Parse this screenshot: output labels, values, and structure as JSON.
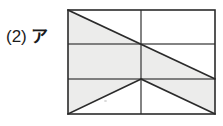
{
  "page": {
    "background_color": "#ffffff",
    "width": 223,
    "height": 126
  },
  "label": {
    "number": "(2)",
    "kana": "ア"
  },
  "figure": {
    "name": "subdivided-rectangle-with-diagonals",
    "stroke_color": "#2b2b2b",
    "grid_stroke_color": "#5a5a5a",
    "shade_color": "#ececeb",
    "stroke_width": 1.6,
    "grid_stroke_width": 1.5,
    "rect": {
      "x": 68,
      "y": 10,
      "width": 147,
      "height": 104
    },
    "rows_y": [
      10,
      44,
      79,
      114
    ],
    "cols_x": [
      68,
      141,
      215
    ],
    "diagonals": [
      {
        "name": "top-left-to-mid-right",
        "x1": 68,
        "y1": 10,
        "x2": 215,
        "y2": 79
      },
      {
        "name": "bottom-left-to-center",
        "x1": 68,
        "y1": 114,
        "x2": 141,
        "y2": 79
      },
      {
        "name": "center-to-bottom-right",
        "x1": 141,
        "y1": 79,
        "x2": 215,
        "y2": 114
      }
    ],
    "shaded_regions": [
      {
        "name": "top-left-triangle",
        "points": "68,10 141,44 68,44"
      },
      {
        "name": "middle-left-cell",
        "points": "68,44 141,44 141,79 68,79"
      },
      {
        "name": "middle-right-triangle",
        "points": "141,44 215,79 141,79"
      },
      {
        "name": "bottom-left-triangle",
        "points": "68,79 141,79 68,114"
      },
      {
        "name": "bottom-right-triangle",
        "points": "141,79 215,79 215,114"
      }
    ]
  }
}
